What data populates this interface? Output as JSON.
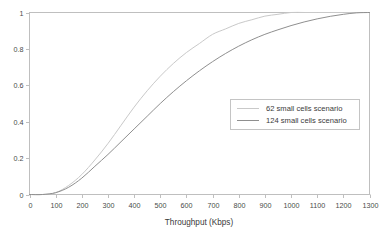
{
  "chart_data": {
    "type": "line",
    "title": "",
    "xlabel": "Throughput (Kbps)",
    "ylabel": "",
    "xlim": [
      0,
      1300
    ],
    "ylim": [
      0,
      1
    ],
    "xticks": [
      0,
      100,
      200,
      300,
      400,
      500,
      600,
      700,
      800,
      900,
      1000,
      1100,
      1200,
      1300
    ],
    "yticks": [
      0,
      0.2,
      0.4,
      0.6,
      0.8,
      1
    ],
    "xtick_labels": [
      "0",
      "100",
      "200",
      "300",
      "400",
      "500",
      "600",
      "700",
      "800",
      "900",
      "1000",
      "1100",
      "1200",
      "1300"
    ],
    "ytick_labels": [
      "0",
      "0.2",
      "0.4",
      "0.6",
      "0.8",
      "1"
    ],
    "grid": false,
    "legend_position": "center-right",
    "x": [
      0,
      50,
      100,
      150,
      200,
      250,
      300,
      350,
      400,
      450,
      500,
      550,
      600,
      650,
      700,
      750,
      800,
      850,
      900,
      950,
      1000,
      1050,
      1100,
      1150,
      1200,
      1250,
      1300
    ],
    "series": [
      {
        "name": "62 small cells scenario",
        "color": "#c9c9c9",
        "values": [
          0,
          0,
          0.01,
          0.05,
          0.11,
          0.19,
          0.28,
          0.38,
          0.48,
          0.57,
          0.65,
          0.72,
          0.78,
          0.83,
          0.88,
          0.91,
          0.94,
          0.96,
          0.98,
          0.99,
          1,
          1,
          1,
          1,
          1,
          1,
          1
        ]
      },
      {
        "name": "124 small cells scenario",
        "color": "#8f8f8f",
        "values": [
          0,
          0,
          0.01,
          0.04,
          0.09,
          0.155,
          0.22,
          0.29,
          0.36,
          0.43,
          0.5,
          0.565,
          0.625,
          0.68,
          0.73,
          0.775,
          0.815,
          0.85,
          0.88,
          0.905,
          0.928,
          0.948,
          0.965,
          0.979,
          0.99,
          0.998,
          1
        ]
      }
    ],
    "legend_entries": [
      {
        "label": "62 small cells scenario",
        "color": "#c9c9c9"
      },
      {
        "label": "124 small cells scenario",
        "color": "#8f8f8f"
      }
    ]
  },
  "axes": {
    "frame_color": "#b5b5b5"
  }
}
